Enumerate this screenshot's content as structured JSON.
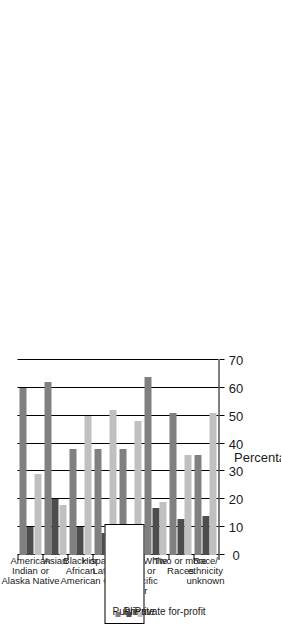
{
  "chart_data": {
    "type": "bar",
    "orientation": "vertical-grouped",
    "title": "",
    "xlabel": "",
    "ylabel": "Percentage",
    "ylim": [
      0,
      70
    ],
    "yticks": [
      0,
      10,
      20,
      30,
      40,
      50,
      60,
      70
    ],
    "grid": true,
    "legend_position": "top-right",
    "categories": [
      "American Indian or Alaska Native",
      "Asian",
      "Black or African American",
      "Hispanic or Latino",
      "Native Hawaiian or Other Pacific Islander",
      "White",
      "Two or more Races",
      "Race/ethnicity unknown"
    ],
    "category_lines": [
      [
        "American",
        "Indian or",
        "Alaska Native"
      ],
      [
        "Asian"
      ],
      [
        "Black or",
        "African",
        "American"
      ],
      [
        "Hispanic or",
        "Latino"
      ],
      [
        "Native",
        "Hawaiian or",
        "Other Pacific",
        "Islander"
      ],
      [
        "White"
      ],
      [
        "Two or more",
        "Races"
      ],
      [
        "Race/",
        "ethnicity",
        "unknown"
      ]
    ],
    "series": [
      {
        "name": "Public",
        "color": "#808080",
        "values": [
          60,
          62,
          38,
          38,
          38,
          64,
          51,
          36
        ]
      },
      {
        "name": "Private",
        "color": "#4d4d4d",
        "values": [
          10,
          20,
          10,
          8,
          10,
          17,
          13,
          14
        ]
      },
      {
        "name": "Private for-profit",
        "color": "#c0c0c0",
        "values": [
          29,
          18,
          50,
          52,
          48,
          19,
          36,
          51
        ]
      }
    ]
  },
  "axis": {
    "title": "Percentage",
    "ticks": [
      "0",
      "10",
      "20",
      "30",
      "40",
      "50",
      "60",
      "70"
    ]
  },
  "legend": {
    "items": [
      {
        "label": "Public"
      },
      {
        "label": "Private"
      },
      {
        "label": "Private for-profit"
      }
    ]
  }
}
